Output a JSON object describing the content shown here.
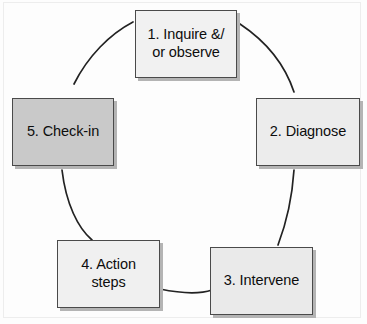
{
  "diagram": {
    "type": "cycle",
    "shape": "circular flow of five boxes connected by arcs",
    "nodes": [
      {
        "id": "node-1",
        "step": "1",
        "label": "1. Inquire &/\nor observe",
        "fill": "#f1f1f1",
        "position": "top"
      },
      {
        "id": "node-2",
        "step": "2",
        "label": "2. Diagnose",
        "fill": "#ececec",
        "position": "right"
      },
      {
        "id": "node-3",
        "step": "3",
        "label": "3. Intervene",
        "fill": "#eaeaea",
        "position": "bottom-right"
      },
      {
        "id": "node-4",
        "step": "4",
        "label": "4. Action\nsteps",
        "fill": "#f0f0f0",
        "position": "bottom-left"
      },
      {
        "id": "node-5",
        "step": "5",
        "label": "5. Check-in",
        "fill": "#c9c9c9",
        "position": "left"
      }
    ],
    "colors": {
      "border": "#4a4a4a",
      "shadow": "#b4b4b4",
      "arc": "#222222",
      "text": "#0d0d0d",
      "background": "#fdfdfd",
      "frame": "#ededed"
    }
  }
}
